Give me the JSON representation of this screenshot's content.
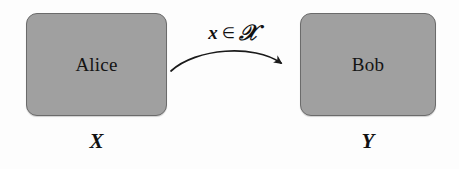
{
  "diagram": {
    "background_color": "#fdfdfd",
    "box_fill_color": "#a0a0a0",
    "box_border_color": "#6b6b6b",
    "text_color": "#111111",
    "arrow_color": "#1a1a1a"
  },
  "sender": {
    "name": "Alice",
    "set_label": "X"
  },
  "receiver": {
    "name": "Bob",
    "set_label": "Y"
  },
  "message": {
    "variable": "x",
    "operator": "∈",
    "set": "𝒳",
    "full": "x ∈ 𝒳"
  }
}
